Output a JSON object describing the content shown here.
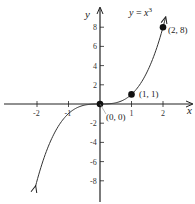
{
  "chart_data": {
    "type": "line",
    "xlabel": "x",
    "ylabel": "y",
    "function": "y = x^3",
    "xlim": [
      -2.9,
      2.9
    ],
    "ylim": [
      -9.5,
      10
    ],
    "x_ticks": [
      -2,
      -1,
      1,
      2
    ],
    "y_ticks": [
      -8,
      -6,
      -4,
      -2,
      2,
      4,
      6,
      8
    ],
    "x_tick_labels": [
      "-2",
      "-1",
      "1",
      "2"
    ],
    "y_tick_labels": [
      "-8",
      "-6",
      "-4",
      "-2",
      "2",
      "4",
      "6",
      "8"
    ],
    "grid": false,
    "series": [
      {
        "name": "y = x^3",
        "x": [
          -2.05,
          -1.5,
          -1,
          -0.5,
          0,
          0.5,
          1,
          1.5,
          2,
          2.1
        ],
        "y": [
          -8.6,
          -3.375,
          -1,
          -0.125,
          0,
          0.125,
          1,
          3.375,
          8,
          9.26
        ]
      }
    ],
    "points": [
      {
        "x": 0,
        "y": 0,
        "label": "(0, 0)"
      },
      {
        "x": 1,
        "y": 1,
        "label": "(1, 1)"
      },
      {
        "x": 2,
        "y": 8,
        "label": "(2, 8)"
      }
    ]
  },
  "labels": {
    "equation_y": "y",
    "equation_eq": " = ",
    "equation_x": "x",
    "equation_exp": "3",
    "x_axis": "x",
    "y_axis": "y",
    "pt0": "(0, 0)",
    "pt1": "(1, 1)",
    "pt2": "(2, 8)"
  }
}
